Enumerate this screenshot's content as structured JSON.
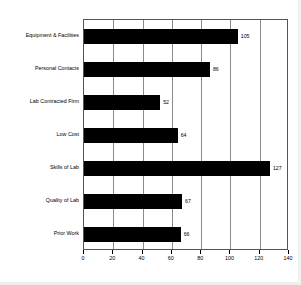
{
  "chart_data": {
    "type": "bar",
    "orientation": "horizontal",
    "title": "",
    "xlabel": "",
    "ylabel": "",
    "categories": [
      "Equipment & Facilities",
      "Personal Contacts",
      "Lab Contracted Firm",
      "Low Cost",
      "Skills of Lab",
      "Quality of Lab",
      "Prior Work"
    ],
    "values": [
      105,
      86,
      52,
      64,
      127,
      67,
      66
    ],
    "value_labels": [
      "105",
      "86",
      "52",
      "64",
      "127",
      "67",
      "66"
    ],
    "xlim": [
      0,
      140
    ],
    "xticks": [
      0,
      20,
      40,
      60,
      80,
      100,
      120,
      140
    ],
    "xtick_labels": [
      "0",
      "20",
      "40",
      "60",
      "80",
      "100",
      "120",
      "140"
    ],
    "grid": "vertical",
    "legend": "none",
    "bar_color": "#000000",
    "grid_color": "#8a8a8a",
    "frame_color": "#555555",
    "background_color": "#ffffff"
  }
}
